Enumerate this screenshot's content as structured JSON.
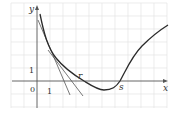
{
  "diagram": {
    "type": "function-graph-newton-method",
    "axes": {
      "x_label": "x",
      "y_label": "y",
      "origin_label": "0",
      "x_unit_label": "1",
      "y_unit_label": "1"
    },
    "points": {
      "r_label": "r",
      "s_label": "s"
    },
    "curve_description": "Decreasing convex curve from upper-left, dipping below x-axis, crossing at s, rising to upper-right",
    "tangent_lines": 2,
    "colors": {
      "grid": "#e4e4e4",
      "axis": "#555555",
      "curve": "#2a2a2a",
      "tangent": "#555555"
    }
  }
}
